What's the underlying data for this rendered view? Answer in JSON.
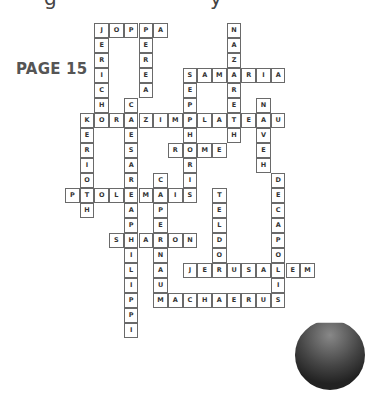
{
  "header": {
    "cutoff_glyphs": [
      {
        "char": "g",
        "x": 44
      },
      {
        "char": "y",
        "x": 210
      }
    ],
    "page_label": "PAGE 15"
  },
  "crossword": {
    "cell_width": 14.7,
    "cell_height": 15,
    "origin_x": 65,
    "origin_y": 23,
    "words": [
      {
        "word": "JOPPA",
        "dir": "across",
        "row": 0,
        "col": 2
      },
      {
        "word": "JERICHO",
        "dir": "down",
        "row": 0,
        "col": 2,
        "visible": "JERICH"
      },
      {
        "word": "PEREA",
        "dir": "down",
        "row": 0,
        "col": 5
      },
      {
        "word": "NAZARETH",
        "dir": "down",
        "row": 0,
        "col": 11
      },
      {
        "word": "SAMARIA",
        "dir": "across",
        "row": 3,
        "col": 8
      },
      {
        "word": "SEPPHORIS",
        "dir": "down",
        "row": 3,
        "col": 8
      },
      {
        "word": "CAESAREAPHILIPPI",
        "dir": "down",
        "row": 5,
        "col": 4
      },
      {
        "word": "NAVEH",
        "dir": "down",
        "row": 5,
        "col": 13
      },
      {
        "word": "KORAZIMPLATEAU",
        "dir": "across",
        "row": 6,
        "col": 1
      },
      {
        "word": "KERIOTH",
        "dir": "down",
        "row": 6,
        "col": 1
      },
      {
        "word": "ROME",
        "dir": "across",
        "row": 8,
        "col": 7
      },
      {
        "word": "CAPERNAUM",
        "dir": "down",
        "row": 10,
        "col": 6
      },
      {
        "word": "DECAPOLIS",
        "dir": "down",
        "row": 10,
        "col": 14
      },
      {
        "word": "PTOLEMAIS",
        "dir": "across",
        "row": 11,
        "col": 0
      },
      {
        "word": "TELDOR",
        "dir": "down",
        "row": 11,
        "col": 10
      },
      {
        "word": "SHARON",
        "dir": "across",
        "row": 14,
        "col": 3
      },
      {
        "word": "JERUSALEM",
        "dir": "across",
        "row": 16,
        "col": 8
      },
      {
        "word": "MACHAERUS",
        "dir": "across",
        "row": 18,
        "col": 6
      }
    ]
  }
}
